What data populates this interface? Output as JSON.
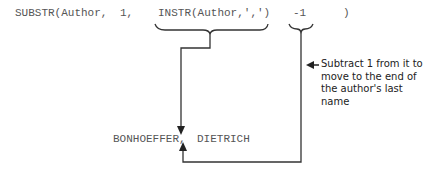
{
  "expression": {
    "func": "SUBSTR(Author,",
    "start": "1,",
    "instr": "INSTR(Author,',')",
    "minus": "-1",
    "close": ")"
  },
  "annotation": {
    "line1": "Subtract 1 from it to",
    "line2": "move to the end of",
    "line3": "the author's last name"
  },
  "result": {
    "last": "BONHOEFFER,",
    "first": "DIETRICH"
  },
  "colors": {
    "line": "#333333",
    "text": "#555555"
  }
}
